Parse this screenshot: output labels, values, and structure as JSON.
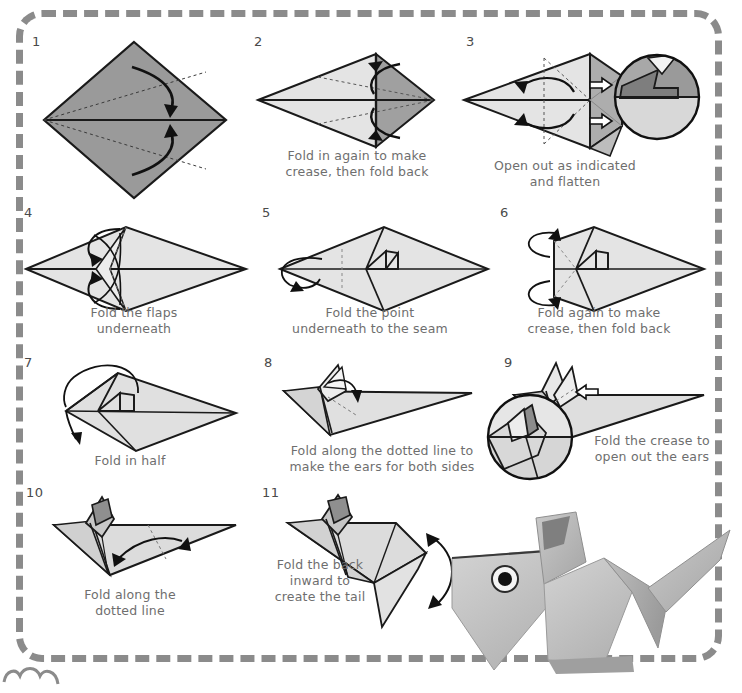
{
  "document": {
    "title": "Origami Mouse Folding Instructions",
    "background_color": "#ffffff",
    "border_color": "#8b8b8b",
    "paper_light": "#e2e2e2",
    "paper_mid": "#cfcfcf",
    "paper_dark": "#8f8f8f",
    "ink_color": "#1a1a1a",
    "caption_color": "#6e6e6e"
  },
  "steps": [
    {
      "number": "1",
      "caption": "",
      "figure": "square-diamond-with-crease-arrows"
    },
    {
      "number": "2",
      "caption": "Fold in again to make\ncrease, then fold back",
      "figure": "kite-with-two-curved-arrows"
    },
    {
      "number": "3",
      "caption": "Open out as indicated\nand flatten",
      "figure": "kite-with-push-arrows-and-magnifier"
    },
    {
      "number": "4",
      "caption": "Fold the flaps\nunderneath",
      "figure": "rhombus-with-loop-arrows"
    },
    {
      "number": "5",
      "caption": "Fold the point\nunderneath to the seam",
      "figure": "rhombus-notched-with-loop-arrow"
    },
    {
      "number": "6",
      "caption": "Fold again to make\ncrease, then fold back",
      "figure": "flat-edge-with-two-loop-arrows"
    },
    {
      "number": "7",
      "caption": "Fold in half",
      "figure": "notched-shape-with-big-arc-arrow"
    },
    {
      "number": "8",
      "caption": "Fold along the dotted line to\nmake the ears for both sides",
      "figure": "side-view-with-ear-flap"
    },
    {
      "number": "9",
      "caption": "Fold the crease to\nopen out the ears",
      "figure": "side-view-with-push-arrow-and-magnifier"
    },
    {
      "number": "10",
      "caption": "Fold along the\ndotted line",
      "figure": "mouse-body-with-double-arrow"
    },
    {
      "number": "11",
      "caption": "Fold the back\ninward to\ncreate the tail",
      "figure": "mouse-with-tail-and-double-arrow"
    }
  ],
  "final_model": {
    "label": "finished-origami-mouse-photo",
    "description": "Completed folded paper mouse with eye sticker and tail"
  },
  "decoration": {
    "corner_scallop": "cloud-scallop-decoration"
  }
}
